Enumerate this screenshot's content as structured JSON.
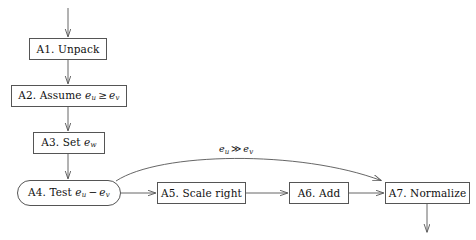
{
  "diagram": {
    "type": "flowchart",
    "title": "",
    "background_color": "#ffffff",
    "stroke_color": "#555555",
    "text_color": "#111111",
    "nodes": [
      {
        "id": "A1",
        "shape": "rectangle",
        "label": "A1. Unpack",
        "label_parts": {
          "prefix": "A1. Unpack"
        },
        "x": 29,
        "y": 38,
        "w": 78,
        "h": 22
      },
      {
        "id": "A2",
        "shape": "rectangle",
        "label": "A2. Assume e_u ≥ e_v",
        "label_parts": {
          "prefix": "A2. Assume",
          "var1": "e",
          "sub1": "u",
          "op": "≥",
          "var2": "e",
          "sub2": "v"
        },
        "x": 11,
        "y": 85,
        "w": 116,
        "h": 22
      },
      {
        "id": "A3",
        "shape": "rectangle",
        "label": "A3. Set e_w",
        "label_parts": {
          "prefix": "A3. Set",
          "var1": "e",
          "sub1": "w"
        },
        "x": 33,
        "y": 132,
        "w": 72,
        "h": 22
      },
      {
        "id": "A4",
        "shape": "stadium",
        "label": "A4. Test e_u − e_v",
        "label_parts": {
          "prefix": "A4. Test",
          "var1": "e",
          "sub1": "u",
          "op": "−",
          "var2": "e",
          "sub2": "v"
        },
        "x": 17,
        "y": 180,
        "w": 104,
        "h": 26
      },
      {
        "id": "A5",
        "shape": "rectangle",
        "label": "A5. Scale right",
        "label_parts": {
          "prefix": "A5. Scale right"
        },
        "x": 157,
        "y": 182,
        "w": 89,
        "h": 22
      },
      {
        "id": "A6",
        "shape": "rectangle",
        "label": "A6. Add",
        "label_parts": {
          "prefix": "A6. Add"
        },
        "x": 289,
        "y": 182,
        "w": 60,
        "h": 22
      },
      {
        "id": "A7",
        "shape": "rectangle",
        "label": "A7. Normalize",
        "label_parts": {
          "prefix": "A7. Normalize"
        },
        "x": 385,
        "y": 182,
        "w": 85,
        "h": 22
      }
    ],
    "edges": [
      {
        "id": "in-A1",
        "from": "",
        "to": "A1",
        "style": "straight",
        "label": ""
      },
      {
        "id": "A1-A2",
        "from": "A1",
        "to": "A2",
        "style": "straight",
        "label": ""
      },
      {
        "id": "A2-A3",
        "from": "A2",
        "to": "A3",
        "style": "straight",
        "label": ""
      },
      {
        "id": "A3-A4",
        "from": "A3",
        "to": "A4",
        "style": "straight",
        "label": ""
      },
      {
        "id": "A4-A5",
        "from": "A4",
        "to": "A5",
        "style": "straight",
        "label": ""
      },
      {
        "id": "A5-A6",
        "from": "A5",
        "to": "A6",
        "style": "straight",
        "label": ""
      },
      {
        "id": "A6-A7",
        "from": "A6",
        "to": "A7",
        "style": "straight",
        "label": ""
      },
      {
        "id": "A4-A7-bypass",
        "from": "A4",
        "to": "A7",
        "style": "curved",
        "label": "e_u ≫ e_v",
        "label_parts": {
          "var1": "e",
          "sub1": "u",
          "op": "≫",
          "var2": "e",
          "sub2": "v"
        }
      },
      {
        "id": "A7-out",
        "from": "A7",
        "to": "",
        "style": "straight",
        "label": ""
      }
    ],
    "edge_label_bypass": {
      "var1": "e",
      "sub1": "u",
      "op": "≫",
      "var2": "e",
      "sub2": "v"
    }
  }
}
